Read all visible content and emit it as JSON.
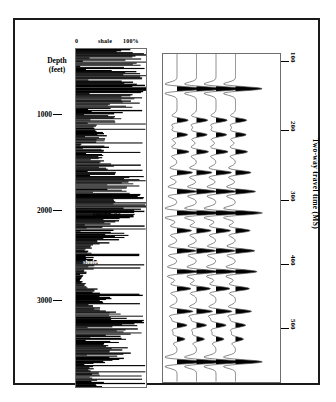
{
  "figure": {
    "frame_color": "#1a1a1a",
    "background": "#ffffff"
  },
  "log_panel": {
    "header_left": "0",
    "header_center": "shale",
    "header_right": "100%",
    "axis_title_line1": "Depth",
    "axis_title_line2": "(feet)",
    "depth_ticks": [
      {
        "label": "1000",
        "y": 112
      },
      {
        "label": "2000",
        "y": 208
      },
      {
        "label": "3000",
        "y": 298
      }
    ],
    "annotations": [
      {
        "label": "sandstone",
        "x": 78,
        "y": 190,
        "style": "dark"
      },
      {
        "label": "shale",
        "x": 68,
        "y": 238,
        "style": "light"
      }
    ]
  },
  "seismic_panel": {
    "axis_title": "Two-way travel time (MS)",
    "time_ticks": [
      {
        "label": "100",
        "y": 59
      },
      {
        "label": "200",
        "y": 128
      },
      {
        "label": "300",
        "y": 198
      },
      {
        "label": "400",
        "y": 262
      },
      {
        "label": "500",
        "y": 326
      }
    ],
    "trace_count": 4,
    "fill_color": "#000000",
    "wiggle_color": "#555555"
  },
  "chart_data": {
    "type": "line",
    "xlabel": "shale (0 to 100%)",
    "ylabel": "Depth (feet) / Two-way travel time (MS)",
    "grid": false,
    "legend": "none",
    "panels": [
      {
        "name": "shale-volume-log",
        "type": "bar",
        "orientation": "horizontal",
        "xlim": [
          0,
          100
        ],
        "ylim": [
          400,
          3600
        ],
        "ylabel": "Depth (feet)",
        "ytick_labels": [
          "1000",
          "2000",
          "3000"
        ],
        "ytick_values": [
          1000,
          2000,
          3000
        ],
        "xtick_labels": [
          "0",
          "100%"
        ],
        "annotations": [
          "sandstone",
          "shale"
        ],
        "description": "High-frequency horizontal bar log of shale fraction versus depth; long black bars indicate shale-rich intervals, white gaps indicate sandstone."
      },
      {
        "name": "synthetic-seismic-traces",
        "type": "line",
        "trace_count": 4,
        "fill": "variable-area-positive",
        "ylim": [
          40,
          560
        ],
        "ylabel": "Two-way travel time (MS)",
        "ytick_labels": [
          "100",
          "200",
          "300",
          "400",
          "500"
        ],
        "ytick_values": [
          100,
          200,
          300,
          400,
          500
        ],
        "reflection_events_ms": [
          95,
          145,
          168,
          195,
          228,
          258,
          292,
          320,
          352,
          385,
          412,
          448,
          470,
          492,
          528
        ],
        "reflection_amplitudes": [
          1.0,
          0.42,
          0.4,
          0.45,
          0.58,
          0.75,
          1.0,
          0.55,
          0.72,
          0.8,
          0.52,
          0.6,
          0.38,
          0.3,
          1.0
        ],
        "description": "Four near-identical wiggle traces with black positive-amplitude variable-area fill; strongest events at about 95, 300 and 530 ms."
      }
    ]
  }
}
